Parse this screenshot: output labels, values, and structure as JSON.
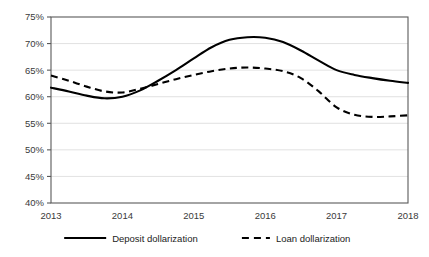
{
  "chart_data": {
    "type": "line",
    "title": "",
    "xlabel": "",
    "ylabel": "",
    "ylim": [
      40,
      75
    ],
    "ytick_values": [
      40,
      45,
      50,
      55,
      60,
      65,
      70,
      75
    ],
    "ytick_labels": [
      "40%",
      "45%",
      "50%",
      "55%",
      "60%",
      "65%",
      "70%",
      "75%"
    ],
    "categories": [
      "2013",
      "2014",
      "2015",
      "2016",
      "2017",
      "2018"
    ],
    "x": [
      2013,
      2014,
      2015,
      2016,
      2017,
      2018
    ],
    "grid": "horizontal",
    "legend_position": "bottom",
    "series": [
      {
        "name": "Deposit dollarization",
        "style": "solid",
        "color": "#000000",
        "values": [
          61.7,
          60.0,
          65.5,
          71.2,
          65.0,
          62.6
        ],
        "dense_x": [
          2013.0,
          2013.25,
          2013.5,
          2013.75,
          2014.0,
          2014.25,
          2014.5,
          2014.75,
          2015.0,
          2015.25,
          2015.5,
          2015.75,
          2016.0,
          2016.25,
          2016.5,
          2016.75,
          2017.0,
          2017.25,
          2017.5,
          2017.75,
          2018.0
        ],
        "dense_values": [
          61.7,
          61.0,
          60.2,
          59.7,
          60.0,
          61.2,
          63.0,
          65.0,
          67.2,
          69.3,
          70.7,
          71.2,
          71.1,
          70.3,
          68.7,
          66.8,
          65.0,
          64.1,
          63.5,
          63.0,
          62.6
        ]
      },
      {
        "name": "Loan dollarization",
        "style": "dashed",
        "color": "#000000",
        "values": [
          64.0,
          60.8,
          63.5,
          65.4,
          58.0,
          56.5
        ],
        "dense_x": [
          2013.0,
          2013.25,
          2013.5,
          2013.75,
          2014.0,
          2014.25,
          2014.5,
          2014.75,
          2015.0,
          2015.25,
          2015.5,
          2015.75,
          2016.0,
          2016.25,
          2016.5,
          2016.75,
          2017.0,
          2017.25,
          2017.5,
          2017.75,
          2018.0
        ],
        "dense_values": [
          64.0,
          63.0,
          61.9,
          61.0,
          60.8,
          61.5,
          62.4,
          63.3,
          64.1,
          64.8,
          65.3,
          65.5,
          65.3,
          64.8,
          63.5,
          61.0,
          58.0,
          56.6,
          56.2,
          56.3,
          56.5
        ]
      }
    ],
    "legend": [
      {
        "label": "Deposit dollarization",
        "style": "solid"
      },
      {
        "label": "Loan dollarization",
        "style": "dashed"
      }
    ]
  },
  "colors": {
    "gridline": "#d9d9d9",
    "axis": "#595959",
    "series": "#000000",
    "tick_text": "#3a3a3a",
    "background": "#ffffff"
  }
}
